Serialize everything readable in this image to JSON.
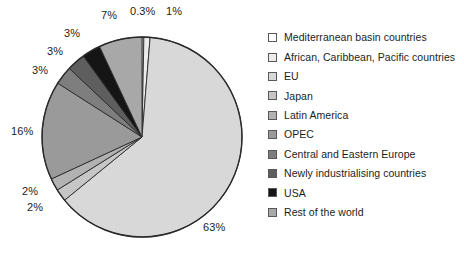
{
  "chart_data": {
    "type": "pie",
    "title": "",
    "subtitle": "",
    "xlabel": "",
    "ylabel": "",
    "grid": false,
    "legend_position": "right",
    "start_angle_deg": 0,
    "direction": "clockwise",
    "categories": [
      "Mediterranean basin countries",
      "African, Caribbean, Pacific countries",
      "EU",
      "Japan",
      "Latin America",
      "OPEC",
      "Central and Eastern Europe",
      "Newly industrialising countries",
      "USA",
      "Rest of the world"
    ],
    "values": [
      0.3,
      1,
      63,
      2,
      2,
      16,
      3,
      3,
      3,
      7
    ],
    "labels": [
      "0.3%",
      "1%",
      "63%",
      "2%",
      "2%",
      "16%",
      "3%",
      "3%",
      "3%",
      "7%"
    ],
    "colors": [
      "#ffffff",
      "#ececec",
      "#d8d8d8",
      "#c6c6c6",
      "#b2b2b2",
      "#9a9a9a",
      "#7e7e7e",
      "#5e5e5e",
      "#151515",
      "#a8a8a8"
    ],
    "slice_edge_color": "#2a2a2a",
    "label_color": "#1d1d1d"
  },
  "pie": {
    "center_x": 142,
    "center_y": 137,
    "radius": 100,
    "labels": [
      {
        "text": "0.3%",
        "x": 130,
        "y": 6
      },
      {
        "text": "1%",
        "x": 166,
        "y": 6
      },
      {
        "text": "63%",
        "x": 203,
        "y": 222
      },
      {
        "text": "2%",
        "x": 27,
        "y": 202
      },
      {
        "text": "2%",
        "x": 22,
        "y": 186
      },
      {
        "text": "16%",
        "x": 11,
        "y": 126
      },
      {
        "text": "3%",
        "x": 32,
        "y": 65
      },
      {
        "text": "3%",
        "x": 47,
        "y": 46
      },
      {
        "text": "3%",
        "x": 64,
        "y": 28
      },
      {
        "text": "7%",
        "x": 101,
        "y": 10
      }
    ]
  },
  "legend": {
    "items": [
      {
        "label": "Mediterranean basin countries",
        "swatch": "#ffffff"
      },
      {
        "label": "African, Caribbean, Pacific countries",
        "swatch": "#ececec"
      },
      {
        "label": "EU",
        "swatch": "#d8d8d8"
      },
      {
        "label": "Japan",
        "swatch": "#c6c6c6"
      },
      {
        "label": "Latin America",
        "swatch": "#b2b2b2"
      },
      {
        "label": "OPEC",
        "swatch": "#9a9a9a"
      },
      {
        "label": "Central and Eastern Europe",
        "swatch": "#7e7e7e"
      },
      {
        "label": "Newly industrialising countries",
        "swatch": "#5e5e5e"
      },
      {
        "label": "USA",
        "swatch": "#151515"
      },
      {
        "label": "Rest of the world",
        "swatch": "#a8a8a8"
      }
    ]
  }
}
